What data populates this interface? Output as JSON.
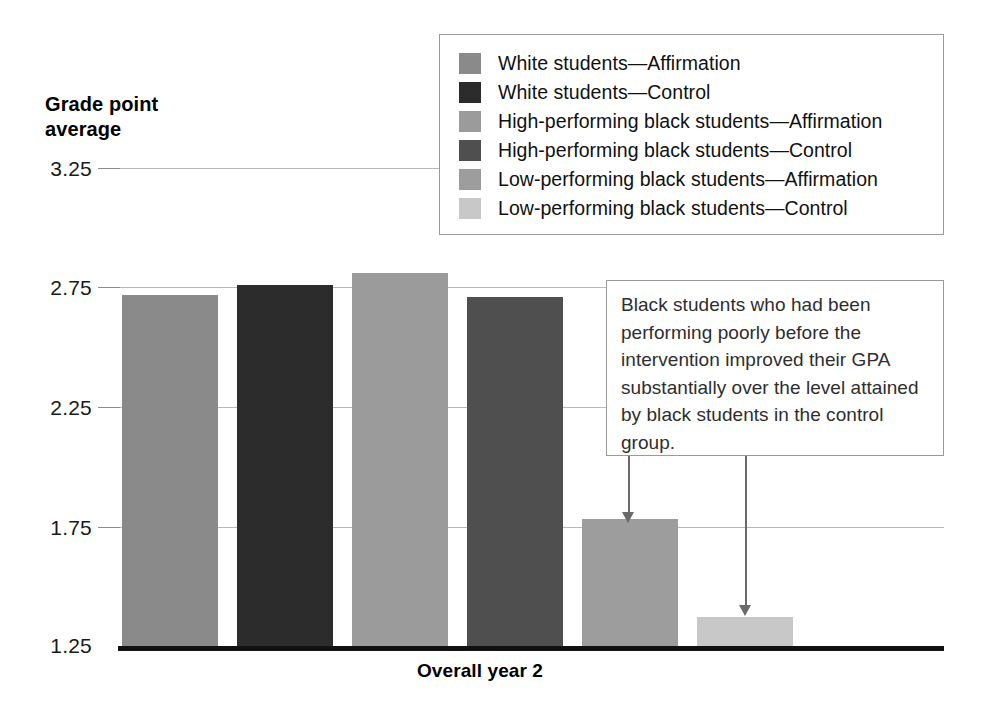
{
  "chart_data": {
    "type": "bar",
    "title": "Grade point average",
    "xlabel": "Overall year 2",
    "ylabel": "Grade point average",
    "categories": [
      "White students—Affirmation",
      "White students—Control",
      "High-performing black students—Affirmation",
      "High-performing black students—Control",
      "Low-performing black students—Affirmation",
      "Low-performing black students—Control"
    ],
    "values": [
      2.72,
      2.76,
      2.81,
      2.71,
      1.78,
      1.37
    ],
    "ylim": [
      1.25,
      3.25
    ],
    "yticks": [
      "1.25",
      "1.75",
      "2.25",
      "2.75",
      "3.25"
    ],
    "ytick_values": [
      1.25,
      1.75,
      2.25,
      2.75,
      3.25
    ],
    "grid": true,
    "legend_position": "top-right",
    "bar_colors": [
      "#8a8a8a",
      "#2c2c2c",
      "#9b9b9b",
      "#4f4f4f",
      "#9d9d9d",
      "#c8c8c8"
    ],
    "annotations": [
      {
        "text": "Black students who had been performing poorly before the intervention improved their GPA substantially over the level attained by black students in the control group.",
        "points_to": [
          "Low-performing black students—Affirmation",
          "Low-performing black students—Control"
        ]
      }
    ]
  },
  "axis": {
    "title_line1": "Grade point",
    "title_line2": "average",
    "x_label": "Overall year 2",
    "tick_3_25": "3.25",
    "tick_2_75": "2.75",
    "tick_2_25": "2.25",
    "tick_1_75": "1.75",
    "tick_1_25": "1.25"
  },
  "legend": {
    "items": [
      {
        "label": "White students—Affirmation",
        "color": "#8a8a8a"
      },
      {
        "label": "White students—Control",
        "color": "#2c2c2c"
      },
      {
        "label": "High-performing black students—Affirmation",
        "color": "#9b9b9b"
      },
      {
        "label": "High-performing black students—Control",
        "color": "#4f4f4f"
      },
      {
        "label": "Low-performing black students—Affirmation",
        "color": "#9d9d9d"
      },
      {
        "label": "Low-performing black students—Control",
        "color": "#c8c8c8"
      }
    ]
  },
  "callout": {
    "text": "Black students who had been performing poorly before the intervention improved their GPA substantially over the level attained by black students in the control group."
  },
  "page_bleed": {
    "line1": "most likely to react to stereotype threat and",
    "line2": "were the ones whose performance improved",
    "line3": "the most after the affirmation exercise, and",
    "line4": "the effects were long lasting. It is not clear",
    "line5": "whether students benefited from writing",
    "line6": "about values or simply from writing."
  }
}
